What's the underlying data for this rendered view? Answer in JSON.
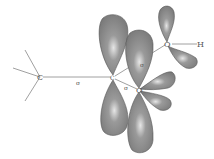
{
  "diagram": {
    "type": "orbital-diagram",
    "atoms": [
      {
        "id": "C1",
        "label": "C",
        "x": 40,
        "y": 77
      },
      {
        "id": "C2",
        "label": "C",
        "x": 113,
        "y": 77
      },
      {
        "id": "O1",
        "label": "O",
        "x": 139,
        "y": 90
      },
      {
        "id": "O2",
        "label": "O",
        "x": 167,
        "y": 44
      },
      {
        "id": "H",
        "label": "H",
        "x": 200,
        "y": 44
      }
    ],
    "bond_labels": [
      {
        "text": "σ",
        "x": 78,
        "y": 84
      },
      {
        "text": "σ",
        "x": 142,
        "y": 66
      },
      {
        "text": "σ",
        "x": 126,
        "y": 89
      }
    ],
    "colors": {
      "lobe": "#8a8a8a",
      "lobe_highlight": "#d8d8d8",
      "line": "#777777"
    }
  }
}
